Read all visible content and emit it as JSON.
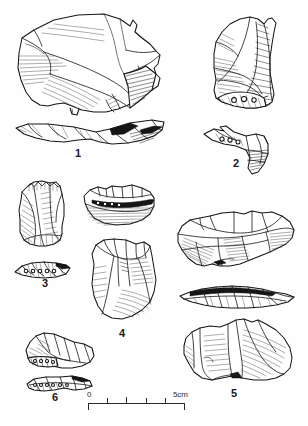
{
  "plate": {
    "title": "Lithic artefact plate",
    "description": "Archaeological line drawings of six flaked stone artefacts, each shown in plan view with an accompanying profile section, drawn in ink with hatched shading.",
    "background_color": "#fefefe",
    "ink_color": "#151515",
    "width_px": 308,
    "height_px": 426
  },
  "artifacts": [
    {
      "number": "1",
      "name": "large-flake",
      "label_position": {
        "x": 70,
        "y": 147
      },
      "views": [
        "plan",
        "section"
      ],
      "description": "Large broad flake with retouched right edge; profile section beneath."
    },
    {
      "number": "2",
      "name": "elongated-core-tool",
      "label_position": {
        "x": 228,
        "y": 157
      },
      "views": [
        "plan",
        "section"
      ],
      "description": "Tall narrow tool with steeply hatched right margin; angled section beneath."
    },
    {
      "number": "3",
      "name": "small-scraper",
      "label_position": {
        "x": 37,
        "y": 277
      },
      "views": [
        "plan",
        "section"
      ],
      "description": "Small elongate scraper with denticulate top edge; thin section beneath."
    },
    {
      "number": "4",
      "name": "ovate-core",
      "label_position": {
        "x": 114,
        "y": 327
      },
      "views": [
        "section",
        "plan"
      ],
      "description": "Ovate core shown with section above and broad plan view below."
    },
    {
      "number": "5",
      "name": "broad-flake-tool",
      "label_position": {
        "x": 226,
        "y": 387
      },
      "views": [
        "plan",
        "section",
        "plan"
      ],
      "description": "Broad multi-facetted flake tool with section and a second lower plan view."
    },
    {
      "number": "6",
      "name": "small-flake",
      "label_position": {
        "x": 47,
        "y": 391
      },
      "views": [
        "plan",
        "section"
      ],
      "description": "Small flake with shallow retouch; narrow section beneath."
    }
  ],
  "scale_bar": {
    "name": "scale-bar",
    "start_label": "0",
    "end_label": "5cm",
    "unit": "cm",
    "length_cm": 5,
    "divisions": 5,
    "tick_labels": [
      "0",
      "",
      "",
      "",
      "",
      "5cm"
    ]
  }
}
